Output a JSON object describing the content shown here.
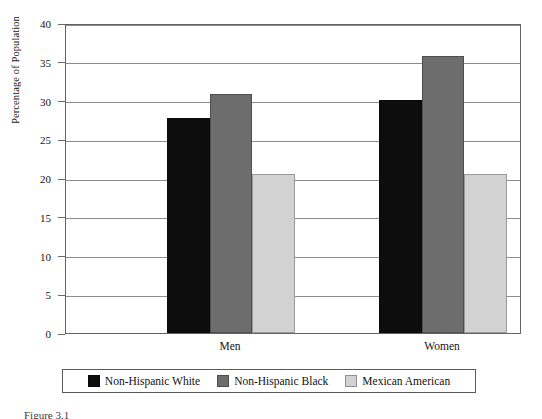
{
  "chart_data": {
    "type": "bar",
    "title": "",
    "subtitle": "",
    "xlabel": "",
    "ylabel": "Percentage of Population",
    "categories": [
      "Men",
      "Women"
    ],
    "series": [
      {
        "name": "Non-Hispanic White",
        "color": "#0d0d0d",
        "values": [
          27.7,
          30.1
        ]
      },
      {
        "name": "Non-Hispanic Black",
        "color": "#6d6d6d",
        "values": [
          30.9,
          35.7
        ]
      },
      {
        "name": "Mexican American",
        "color": "#d2d2d2",
        "values": [
          20.5,
          20.5
        ]
      }
    ],
    "ylim": [
      0,
      40
    ],
    "ytick_values": [
      0,
      5,
      10,
      15,
      20,
      25,
      30,
      35,
      40
    ],
    "ytick_labels": [
      "0",
      "5",
      "10",
      "15",
      "20",
      "25",
      "30",
      "35",
      "40"
    ],
    "grid": true,
    "grid_axis": "y",
    "legend_position": "bottom"
  },
  "legend": {
    "items": [
      {
        "label": "Non-Hispanic White",
        "swatch": "legend-swatch-black"
      },
      {
        "label": "Non-Hispanic Black",
        "swatch": "legend-swatch-dark-grey"
      },
      {
        "label": "Mexican American",
        "swatch": "legend-swatch-light-grey"
      }
    ]
  },
  "caption": {
    "text": "Figure 3.1"
  }
}
